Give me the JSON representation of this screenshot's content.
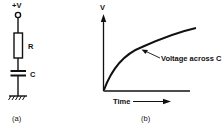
{
  "figure": {
    "panel_a": {
      "caption": "(a)",
      "supply_label": "+V",
      "resistor_label": "R",
      "capacitor_label": "C",
      "components": [
        "supply-terminal",
        "resistor",
        "capacitor",
        "ground"
      ]
    },
    "panel_b": {
      "caption": "(b)",
      "y_axis_label": "V",
      "x_axis_label": "Time",
      "curve_annotation": "Voltage across C",
      "curve_type": "exponential charging"
    }
  },
  "colors": {
    "ink": "#111111",
    "background": "#ffffff"
  }
}
